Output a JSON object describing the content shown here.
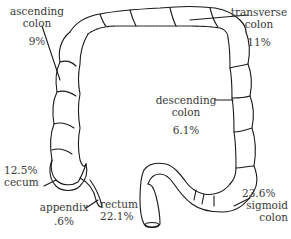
{
  "diagram": {
    "stroke_color": "#1a1a1a",
    "text_color": "#3a3a3a",
    "labels": {
      "ascending": {
        "line1": "ascending",
        "line2": "colon",
        "percent": "9%"
      },
      "transverse": {
        "line1": "transverse",
        "line2": "colon",
        "percent": "11%"
      },
      "descending": {
        "line1": "descending",
        "line2": "colon",
        "percent": "6.1%"
      },
      "cecum": {
        "percent": "12.5%",
        "line1": "cecum"
      },
      "appendix": {
        "line1": "appendix",
        "percent": ".6%"
      },
      "rectum": {
        "line1": "rectum",
        "percent": "22.1%"
      },
      "sigmoid": {
        "percent": "23.6%",
        "line1": "sigmoid",
        "line2": "colon"
      }
    }
  }
}
